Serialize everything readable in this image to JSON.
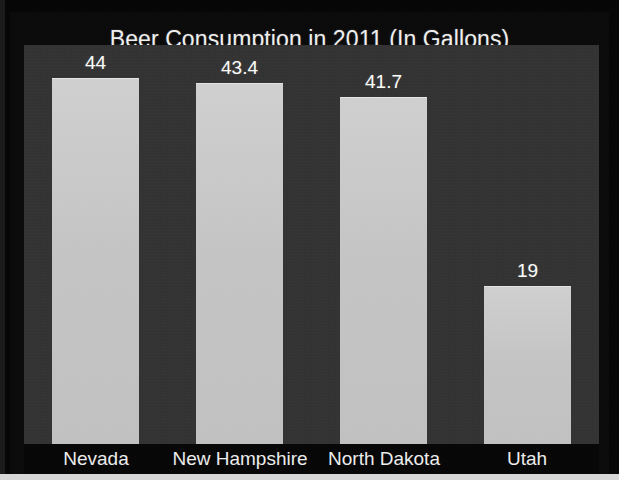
{
  "chart_data": {
    "type": "bar",
    "title": "Beer Consumption in 2011 (In Gallons)",
    "xlabel": "",
    "ylabel": "",
    "categories": [
      "Nevada",
      "New Hampshire",
      "North Dakota",
      "Utah"
    ],
    "values": [
      44,
      43.4,
      41.7,
      19
    ],
    "value_labels": [
      "44",
      "43.4",
      "41.7",
      "19"
    ],
    "ylim": [
      0,
      48
    ],
    "grid": false,
    "legend": false,
    "orientation": "vertical",
    "colors": {
      "bar_fill": "#c9c9c9",
      "plot_background": "#323232",
      "card_background": "#0a0a0a",
      "title_text": "#f2f2f2",
      "value_label_text": "#ffffff",
      "category_label_text": "#efefef"
    }
  },
  "chart": {
    "title": "Beer Consumption in 2011 (In Gallons)",
    "bars": [
      {
        "category": "Nevada",
        "value_label": "44"
      },
      {
        "category": "New Hampshire",
        "value_label": "43.4"
      },
      {
        "category": "North Dakota",
        "value_label": "41.7"
      },
      {
        "category": "Utah",
        "value_label": "19"
      }
    ]
  }
}
